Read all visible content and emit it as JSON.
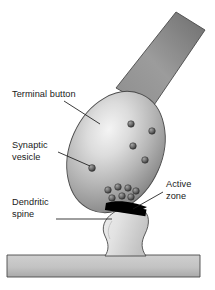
{
  "figure": {
    "background_color": "#ffffff",
    "width": 215,
    "height": 290
  },
  "labels": [
    {
      "id": "terminal-button",
      "lines": [
        "Terminal button"
      ],
      "text": "Terminal button",
      "x": 12,
      "y": 97,
      "anchor": "start",
      "leader": {
        "x1": 64,
        "y1": 101,
        "x2": 100,
        "y2": 124
      }
    },
    {
      "id": "synaptic-vesicle",
      "lines": [
        "Synaptic",
        "vesicle"
      ],
      "text": "Synaptic vesicle",
      "x": 12,
      "y": 148,
      "anchor": "start",
      "leader": {
        "x1": 58,
        "y1": 152,
        "x2": 92,
        "y2": 168
      }
    },
    {
      "id": "dendritic-spine",
      "lines": [
        "Dendritic",
        "spine"
      ],
      "text": "Dendritic spine",
      "x": 12,
      "y": 205,
      "anchor": "start",
      "leader": {
        "x1": 56,
        "y1": 219,
        "x2": 112,
        "y2": 219
      }
    },
    {
      "id": "active-zone",
      "lines": [
        "Active",
        "zone"
      ],
      "text": "Active zone",
      "x": 166,
      "y": 187,
      "anchor": "start",
      "leader": {
        "x1": 163,
        "y1": 192,
        "x2": 134,
        "y2": 209
      }
    }
  ],
  "structures": {
    "axon": {
      "name": "axon",
      "fill_light": "#9b9b9b",
      "fill_dark": "#6f6f6f",
      "description": "diagonal band entering from upper right"
    },
    "terminal_button": {
      "name": "terminal-button",
      "fill_light": "#efefef",
      "fill_mid": "#b4b4b4",
      "fill_dark": "#7d7d7d",
      "description": "tilted ellipse bouton with upper-left highlight"
    },
    "active_zone": {
      "name": "active-zone",
      "fill": "#000000",
      "description": "thick black tilted bar at synaptic contact"
    },
    "dendritic_spine": {
      "name": "dendritic-spine",
      "fill_light": "#f2f2f2",
      "fill_mid": "#c9c9c9",
      "description": "mushroom-shaped spine with narrow neck"
    },
    "dendrite": {
      "name": "dendrite-shaft",
      "fill_light": "#c6c6c6",
      "fill_dark": "#a0a0a0",
      "description": "horizontal dendrite bar at the bottom"
    }
  },
  "vesicles": {
    "name": "synaptic-vesicles",
    "fill_light": "#9a9a9a",
    "fill_dark": "#3c3c3c",
    "labeled_vesicle": {
      "cx": 92,
      "cy": 168,
      "r": 3.4
    },
    "scattered": [
      {
        "cx": 131,
        "cy": 124,
        "r": 3.3
      },
      {
        "cx": 152,
        "cy": 131,
        "r": 3.3
      },
      {
        "cx": 133,
        "cy": 146,
        "r": 3.3
      },
      {
        "cx": 145,
        "cy": 160,
        "r": 3.3
      }
    ],
    "docked_cluster": [
      {
        "cx": 108,
        "cy": 190,
        "r": 3.3
      },
      {
        "cx": 118,
        "cy": 187,
        "r": 3.3
      },
      {
        "cx": 128,
        "cy": 188,
        "r": 3.3
      },
      {
        "cx": 136,
        "cy": 191,
        "r": 3.3
      },
      {
        "cx": 112,
        "cy": 198,
        "r": 3.3
      },
      {
        "cx": 122,
        "cy": 196,
        "r": 3.3
      },
      {
        "cx": 131,
        "cy": 197,
        "r": 3.3
      }
    ]
  }
}
